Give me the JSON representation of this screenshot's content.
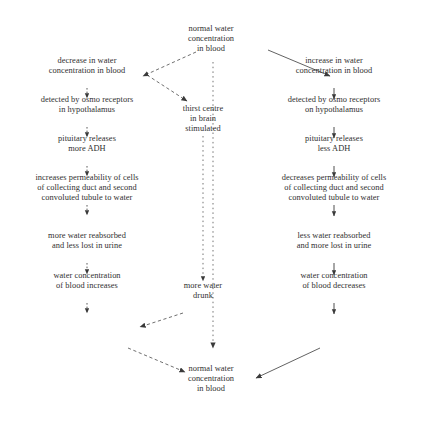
{
  "diagram": {
    "background_color": "#ffffff",
    "text_color": "#2f2f2f",
    "line_color": "#3a3a3a"
  },
  "nodes": {
    "top_normal": "normal water\nconcentration\nin blood",
    "left_1": "decrease in water\nconcentration in blood",
    "left_2": "detected by osmo receptors\nin hypothalamus",
    "left_3": "pituitary releases\nmore ADH",
    "left_4": "increases permeability of cells\nof collecting duct and second\nconvoluted tubule to water",
    "left_5": "more water reabsorbed\nand less lost in urine",
    "left_6": "water concentration\nof blood increases",
    "center_1": "thirst centre\nin brain\nstimulated",
    "center_2": "more water\ndrunk",
    "right_1": "increase in water\nconcentration in blood",
    "right_2": "detected by osmo receptors\non hypothalamus",
    "right_3": "pituitary releases\nless ADH",
    "right_4": "decreases permeability of cells\nof collecting duct and second\nconvoluted tubule to water",
    "right_5": "less water reabsorbed\nand more lost in urine",
    "right_6": "water concentration\nof blood decreases",
    "bottom_normal": "normal water\nconcentration\nin blood"
  },
  "connectors": {
    "top_to_left": "dashed-arrow-top-to-decrease",
    "top_to_right": "solid-arrow-top-to-increase",
    "left_to_thirst": "dashed-arrow-decrease-to-thirst-centre",
    "left_chain": "dotted-arrow-left-column",
    "right_chain": "solid-arrow-right-column",
    "center_chain": "dotted-line-center-column",
    "thirst_to_left_increase": "dashed-arrow-more-water-drunk-to-water-concentration-increases",
    "left_to_bottom": "dashed-arrow-increases-to-normal",
    "center_to_bottom": "dashed-arrow-center-to-normal",
    "right_to_bottom": "solid-arrow-decreases-to-normal"
  }
}
